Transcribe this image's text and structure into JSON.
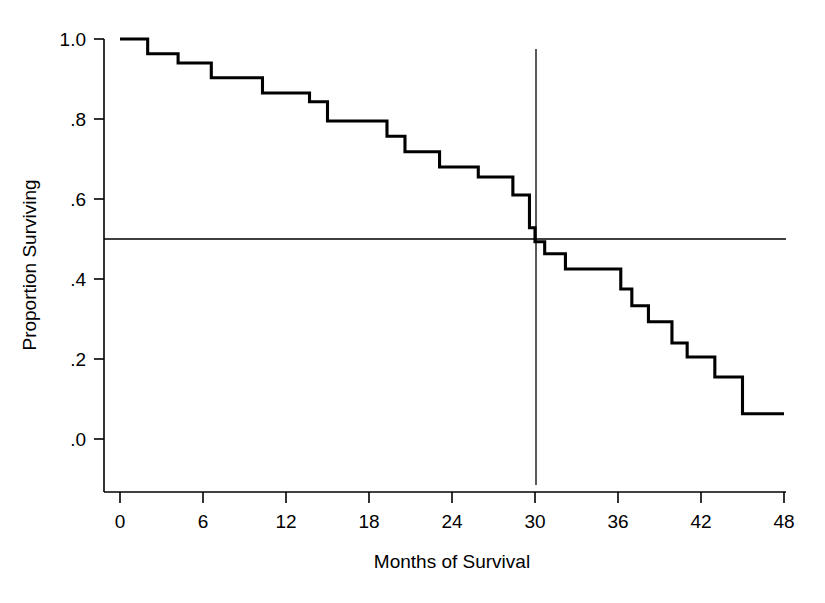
{
  "chart_data": {
    "type": "line",
    "subtype": "kaplan-meier-step",
    "title": "",
    "xlabel": "Months of Survival",
    "ylabel": "Proportion Surviving",
    "xlim": [
      0,
      48
    ],
    "ylim": [
      0.0,
      1.0
    ],
    "xticks": [
      0,
      6,
      12,
      18,
      24,
      30,
      36,
      42,
      48
    ],
    "xtick_labels": [
      "0",
      "6",
      "12",
      "18",
      "24",
      "30",
      "36",
      "42",
      "48"
    ],
    "yticks": [
      0.0,
      0.2,
      0.4,
      0.6,
      0.8,
      1.0
    ],
    "ytick_labels": [
      ".0",
      ".2",
      ".4",
      ".6",
      ".8",
      "1.0"
    ],
    "grid": false,
    "legend": false,
    "curve_color": "#000000",
    "axis_color": "#000000",
    "background_color": "#ffffff",
    "series": [
      {
        "name": "Survival",
        "step": "post",
        "x": [
          0.0,
          2.0,
          2.0,
          4.2,
          4.2,
          6.6,
          6.6,
          10.3,
          10.3,
          13.7,
          13.7,
          15.0,
          15.0,
          19.3,
          19.3,
          20.6,
          20.6,
          23.1,
          23.1,
          25.9,
          25.9,
          28.4,
          28.4,
          29.6,
          29.6,
          30.0,
          30.0,
          30.7,
          30.7,
          32.2,
          32.2,
          36.2,
          36.2,
          37.0,
          37.0,
          38.2,
          38.2,
          39.9,
          39.9,
          41.0,
          41.0,
          43.0,
          43.0,
          45.0,
          45.0,
          48.0
        ],
        "y": [
          1.0,
          1.0,
          0.963,
          0.963,
          0.94,
          0.94,
          0.903,
          0.903,
          0.865,
          0.865,
          0.843,
          0.843,
          0.795,
          0.795,
          0.757,
          0.757,
          0.718,
          0.718,
          0.68,
          0.68,
          0.655,
          0.655,
          0.61,
          0.61,
          0.528,
          0.528,
          0.493,
          0.493,
          0.463,
          0.463,
          0.425,
          0.425,
          0.375,
          0.375,
          0.333,
          0.333,
          0.293,
          0.293,
          0.24,
          0.24,
          0.205,
          0.205,
          0.155,
          0.155,
          0.063,
          0.063
        ]
      }
    ],
    "annotations": [
      {
        "name": "median-horizontal-reference",
        "type": "hline",
        "y": 0.5,
        "x_start": 0.0,
        "x_end": 48.0,
        "label": ""
      },
      {
        "name": "median-vertical-reference",
        "type": "vline",
        "x": 30.0,
        "y_start": -0.115,
        "y_end": 0.975,
        "label": ""
      }
    ],
    "median_survival_months": 30
  },
  "axes": {
    "y_label": "Proportion Surviving",
    "x_label": "Months of Survival",
    "y_tick_labels": [
      "1.0",
      ".8",
      ".6",
      ".4",
      ".2",
      ".0"
    ],
    "x_tick_labels": [
      "0",
      "6",
      "12",
      "18",
      "24",
      "30",
      "36",
      "42",
      "48"
    ]
  }
}
